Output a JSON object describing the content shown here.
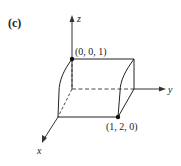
{
  "panel_label": "(c)",
  "axes": {
    "x": "x",
    "y": "y",
    "z": "z"
  },
  "points": [
    {
      "label": "(0, 0, 1)"
    },
    {
      "label": "(1, 2, 0)"
    }
  ]
}
